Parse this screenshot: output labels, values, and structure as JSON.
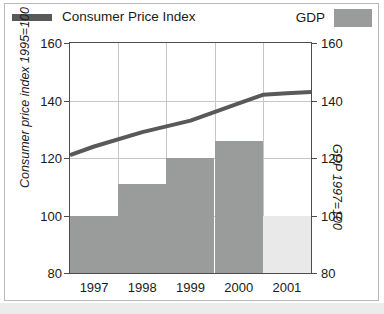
{
  "legend": {
    "line_entry": "Consumer Price Index",
    "bar_entry": "GDP",
    "line_swatch_name": "line-swatch",
    "bar_swatch_name": "bar-swatch"
  },
  "axes": {
    "left_title": "Consumer price index 1995=100",
    "right_title": "GDP 1997=100",
    "left_ticks": [
      "160",
      "140",
      "120",
      "100",
      "80"
    ],
    "right_ticks": [
      "160",
      "140",
      "120",
      "100",
      "80"
    ],
    "x_ticks": [
      "1997",
      "1998",
      "1999",
      "2000",
      "2001"
    ]
  },
  "colors": {
    "line": "#595959",
    "bar": "#9a9b9b",
    "bar_light": "#e9e9e9",
    "grid": "#c6c6c6",
    "frame": "#4d4d4d",
    "text": "#1a1a1a",
    "page_band": "#ececed"
  },
  "chart_data": {
    "type": "bar",
    "title": "",
    "subtitle": "",
    "xlabel": "",
    "ylabel": "Consumer price index 1995=100",
    "y2label": "GDP 1997=100",
    "categories": [
      "1997",
      "1998",
      "1999",
      "2000",
      "2001"
    ],
    "ylim": [
      80,
      160
    ],
    "y2lim": [
      80,
      160
    ],
    "yticks": [
      80,
      100,
      120,
      140,
      160
    ],
    "y2ticks": [
      80,
      100,
      120,
      140,
      160
    ],
    "grid": true,
    "legend_position": "top",
    "series": [
      {
        "name": "GDP",
        "type": "bar",
        "axis": "right",
        "values": [
          100,
          111,
          120,
          126,
          100
        ],
        "colors": [
          "#9a9b9b",
          "#9a9b9b",
          "#9a9b9b",
          "#9a9b9b",
          "#e9e9e9"
        ],
        "note": "2001 bar drawn in light shading (projection)"
      },
      {
        "name": "Consumer Price Index",
        "type": "line",
        "axis": "left",
        "x": [
          "1996.5",
          "1997",
          "1998",
          "1999",
          "2000",
          "2000.5",
          "2001",
          "2001.5"
        ],
        "values": [
          121,
          124,
          129,
          133,
          139,
          142,
          142.5,
          143
        ]
      }
    ]
  }
}
